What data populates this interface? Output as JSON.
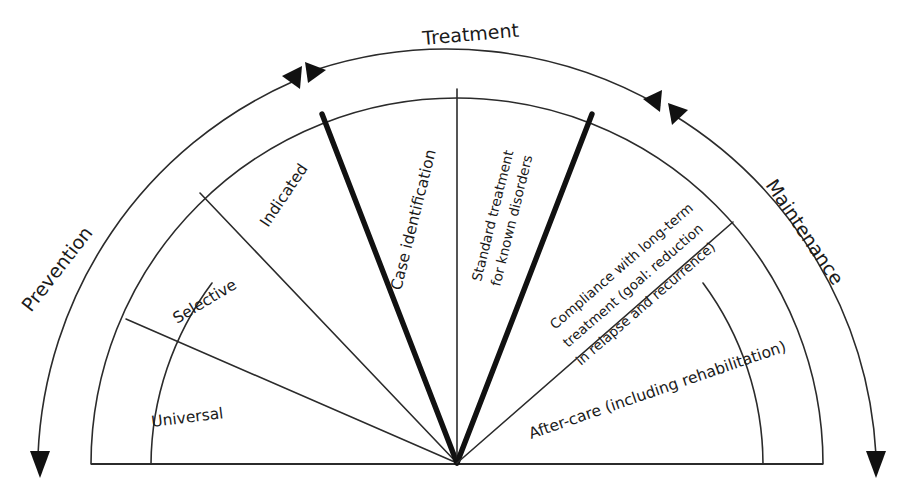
{
  "figure": {
    "type": "semicircular-sector-diagram",
    "background_color": "#ffffff",
    "line_color": "#2b2b2b",
    "bold_line_color": "#111111",
    "text_color": "#1a1a1a"
  },
  "bands": [
    {
      "id": "prevention",
      "label": "Prevention",
      "arrow_direction": "counter-clockwise-down-left",
      "arrowheads": 2
    },
    {
      "id": "treatment",
      "label": "Treatment",
      "arrow_direction": "bidirectional-across-top",
      "arrowheads": 2
    },
    {
      "id": "maintenance",
      "label": "Maintenance",
      "arrow_direction": "clockwise-down-right",
      "arrowheads": 2
    }
  ],
  "sectors": [
    {
      "id": "universal",
      "label": "Universal",
      "lines": [
        "Universal"
      ],
      "band": "prevention",
      "emphasis": "normal"
    },
    {
      "id": "selective",
      "label": "Selective",
      "lines": [
        "Selective"
      ],
      "band": "prevention",
      "emphasis": "normal"
    },
    {
      "id": "indicated",
      "label": "Indicated",
      "lines": [
        "Indicated"
      ],
      "band": "prevention",
      "emphasis": "normal"
    },
    {
      "id": "case-identification",
      "label": "Case identification",
      "lines": [
        "Case identification"
      ],
      "band": "treatment",
      "emphasis": "normal"
    },
    {
      "id": "standard-treatment",
      "label": "Standard treatment for known disorders",
      "lines": [
        "Standard treatment",
        "for known disorders"
      ],
      "band": "treatment",
      "emphasis": "normal"
    },
    {
      "id": "compliance",
      "label": "Compliance with long-term treatment (goal: reduction in relapse and recurrence)",
      "lines": [
        "Compliance with long-term",
        "treatment (goal: reduction",
        "in relapse and recurrence)"
      ],
      "band": "maintenance",
      "emphasis": "normal"
    },
    {
      "id": "after-care",
      "label": "After-care (including rehabilitation)",
      "lines": [
        "After-care (including rehabilitation)"
      ],
      "band": "maintenance",
      "emphasis": "normal"
    }
  ],
  "labels": {
    "universal": "Universal",
    "selective": "Selective",
    "indicated": "Indicated",
    "case_identification": "Case identification",
    "standard_treatment_l1": "Standard treatment",
    "standard_treatment_l2": "for known disorders",
    "compliance_l1": "Compliance with long-term",
    "compliance_l2": "treatment (goal: reduction",
    "compliance_l3": "in relapse and recurrence)",
    "after_care": "After-care (including rehabilitation)",
    "prevention": "Prevention",
    "treatment": "Treatment",
    "maintenance": "Maintenance"
  }
}
